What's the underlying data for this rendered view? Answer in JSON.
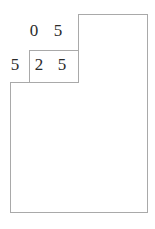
{
  "figure": {
    "kind": "staircase-polygon-with-digits",
    "background_color": "#ffffff",
    "stroke_color": "#a9a9a9",
    "digit_color": "#2b2b2b",
    "stroke_width": 1,
    "canvas": {
      "width": 155,
      "height": 229
    },
    "outline_polygon_points": "78,14 147,14 147,212 10,212 10,82 29,82 29,50 78,50",
    "shapes": [
      {
        "name": "tall-right-rectangle",
        "x": 78,
        "y": 14,
        "width": 69,
        "height": 198
      },
      {
        "name": "middle-cell-box",
        "x": 29,
        "y": 50,
        "width": 49,
        "height": 32
      },
      {
        "name": "lower-left-region",
        "x": 10,
        "y": 82,
        "width": 68,
        "height": 130
      }
    ],
    "rows": [
      {
        "name": "top-digit-row",
        "digits": [
          {
            "value": "0",
            "x": 27,
            "y": 22
          },
          {
            "value": "5",
            "x": 51,
            "y": 22
          }
        ]
      },
      {
        "name": "bottom-digit-row",
        "digits": [
          {
            "value": "5",
            "x": 8,
            "y": 56
          },
          {
            "value": "2",
            "x": 32,
            "y": 56
          },
          {
            "value": "5",
            "x": 55,
            "y": 56
          }
        ]
      }
    ]
  }
}
